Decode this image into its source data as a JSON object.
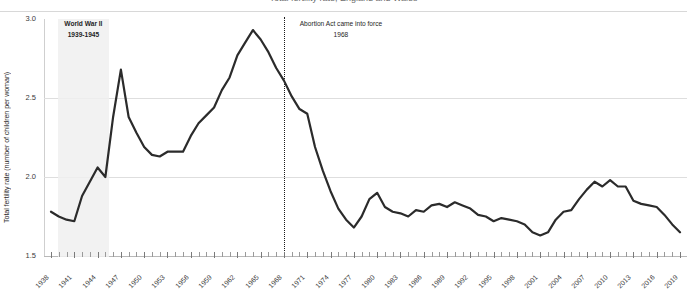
{
  "title": {
    "clipped_text": "Total fertility rate, England and Wales"
  },
  "axes": {
    "ylabel": "Total fertility rate (number of children per woman)",
    "yticks": [
      "3.0",
      "2.5",
      "2.0",
      "1.5"
    ]
  },
  "annotations": {
    "war": {
      "label": "World War II",
      "years": "1939-1945"
    },
    "abortion": {
      "label": "Abortion Act came into force",
      "year": "1968"
    }
  },
  "colors": {
    "line": "#2b2b2b",
    "grid": "#dedede",
    "band": "#f0f0f0",
    "marker": "#1a1a1a"
  },
  "chart_data": {
    "type": "line",
    "title": "Total fertility rate, England and Wales",
    "xlabel": "",
    "ylabel": "Total fertility rate (number of children per woman)",
    "ylim": [
      1.5,
      3.0
    ],
    "xlim": [
      1938,
      2019
    ],
    "grid": true,
    "legend": "none",
    "ytick_values": [
      3.0,
      2.5,
      2.0,
      1.5
    ],
    "xtick_labels": [
      "1938",
      "1941",
      "1944",
      "1947",
      "1950",
      "1953",
      "1956",
      "1959",
      "1962",
      "1965",
      "1968",
      "1971",
      "1974",
      "1977",
      "1980",
      "1983",
      "1986",
      "1989",
      "1992",
      "1995",
      "1998",
      "2001",
      "2004",
      "2007",
      "2010",
      "2013",
      "2016",
      "2019"
    ],
    "x": [
      1938,
      1939,
      1940,
      1941,
      1942,
      1943,
      1944,
      1945,
      1946,
      1947,
      1948,
      1949,
      1950,
      1951,
      1952,
      1953,
      1954,
      1955,
      1956,
      1957,
      1958,
      1959,
      1960,
      1961,
      1962,
      1963,
      1964,
      1965,
      1966,
      1967,
      1968,
      1969,
      1970,
      1971,
      1972,
      1973,
      1974,
      1975,
      1976,
      1977,
      1978,
      1979,
      1980,
      1981,
      1982,
      1983,
      1984,
      1985,
      1986,
      1987,
      1988,
      1989,
      1990,
      1991,
      1992,
      1993,
      1994,
      1995,
      1996,
      1997,
      1998,
      1999,
      2000,
      2001,
      2002,
      2003,
      2004,
      2005,
      2006,
      2007,
      2008,
      2009,
      2010,
      2011,
      2012,
      2013,
      2014,
      2015,
      2016,
      2017,
      2018,
      2019
    ],
    "values": [
      1.78,
      1.75,
      1.73,
      1.72,
      1.88,
      1.97,
      2.06,
      2.0,
      2.38,
      2.68,
      2.38,
      2.28,
      2.19,
      2.14,
      2.13,
      2.16,
      2.16,
      2.16,
      2.26,
      2.34,
      2.39,
      2.44,
      2.55,
      2.63,
      2.77,
      2.85,
      2.93,
      2.87,
      2.79,
      2.69,
      2.61,
      2.51,
      2.43,
      2.4,
      2.19,
      2.04,
      1.91,
      1.8,
      1.73,
      1.68,
      1.75,
      1.86,
      1.9,
      1.81,
      1.78,
      1.77,
      1.75,
      1.79,
      1.78,
      1.82,
      1.83,
      1.81,
      1.84,
      1.82,
      1.8,
      1.76,
      1.75,
      1.72,
      1.74,
      1.73,
      1.72,
      1.7,
      1.65,
      1.63,
      1.65,
      1.73,
      1.78,
      1.79,
      1.86,
      1.92,
      1.97,
      1.94,
      1.98,
      1.94,
      1.94,
      1.85,
      1.83,
      1.82,
      1.81,
      1.76,
      1.7,
      1.65
    ]
  }
}
